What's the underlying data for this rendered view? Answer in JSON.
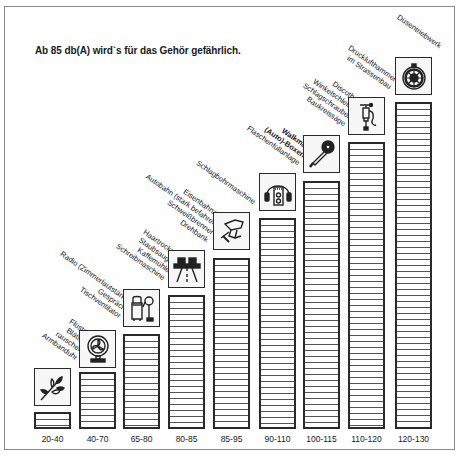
{
  "title": "Ab 85 db(A) wird`s für das Gehör gefährlich.",
  "chart_data": {
    "type": "bar",
    "title": "Ab 85 db(A) wird`s für das Gehör gefährlich.",
    "xlabel": "",
    "ylabel": "dB(A)",
    "categories": [
      "20-40",
      "40-70",
      "65-80",
      "80-85",
      "85-95",
      "90-110",
      "100-115",
      "110-120",
      "120-130"
    ],
    "values": [
      30,
      55,
      72.5,
      82.5,
      90,
      100,
      107.5,
      115,
      125
    ],
    "grid": false,
    "legend": "none",
    "annotations": [
      {
        "category": "20-40",
        "icon": "leaves-icon",
        "lines": [
          "Flüstern",
          "Blätter-",
          "rauschen",
          "Armbanduhr"
        ]
      },
      {
        "category": "40-70",
        "icon": "fan-icon",
        "lines": [
          "Radio (Zimmerlautstärke)",
          "Gespräch",
          "Tischventilator"
        ]
      },
      {
        "category": "65-80",
        "icon": "vacuum-cleaner-icon",
        "lines": [
          "Haartrockner",
          "Staubsauger",
          "Kaffemühle",
          "Schreibmaschine"
        ]
      },
      {
        "category": "80-85",
        "icon": "highway-icon",
        "lines": [
          "Eisenbahnzug",
          "Autobahn (stark befahren)",
          "Schweißbrenner",
          "Drehbank"
        ]
      },
      {
        "category": "85-95",
        "icon": "hammer-drill-icon",
        "lines": [
          "Schlagbohrmaschine"
        ]
      },
      {
        "category": "90-110",
        "icon": "walkman-headphones-icon",
        "lines": [
          "Walkman",
          "(Auto)-Boxen",
          "Flaschenfüllanlage"
        ],
        "bold_lines": [
          0,
          1
        ]
      },
      {
        "category": "100-115",
        "icon": "angle-grinder-icon",
        "lines": [
          "Discothek",
          "Winkelschleifer",
          "Schlagschrauber",
          "Baukreissäge"
        ]
      },
      {
        "category": "110-120",
        "icon": "jackhammer-icon",
        "lines": [
          "Drucklufthammer",
          "im Strassenbau"
        ]
      },
      {
        "category": "120-130",
        "icon": "jet-engine-icon",
        "lines": [
          "Düsentriebwerk"
        ]
      }
    ]
  },
  "bars": [
    {
      "label": "20-40",
      "x": 34,
      "top": 412,
      "icon_top": 368,
      "icon": "leaves-icon",
      "lines": [
        "Flüstern",
        "Blätter-",
        "rauschen",
        "Armbanduhr"
      ],
      "lx": 74,
      "ly": 362
    },
    {
      "label": "40-70",
      "x": 79,
      "top": 372,
      "icon_top": 330,
      "icon": "fan-icon",
      "lines": [
        "Radio (Zimmerlautstärke)",
        "Gespräch",
        "Tischventilator"
      ],
      "lx": 118,
      "ly": 320
    },
    {
      "label": "65-80",
      "x": 123,
      "top": 334,
      "icon_top": 289,
      "icon": "vacuum-cleaner-icon",
      "lines": [
        "Haartrockner",
        "Staubsauger",
        "Kaffemühle",
        "Schreibmaschine"
      ],
      "lx": 162,
      "ly": 282
    },
    {
      "label": "80-85",
      "x": 168,
      "top": 295,
      "icon_top": 250,
      "icon": "highway-icon",
      "lines": [
        "Eisenbahnzug",
        "Autobahn (stark befahren)",
        "Schweißbrenner",
        "Drehbank"
      ],
      "lx": 205,
      "ly": 244
    },
    {
      "label": "85-95",
      "x": 213,
      "top": 258,
      "icon_top": 212,
      "icon": "hammer-drill-icon",
      "lines": [
        "Schlagbohrmaschine"
      ],
      "lx": 252,
      "ly": 206
    },
    {
      "label": "90-110",
      "x": 259,
      "top": 218,
      "icon_top": 173,
      "icon": "walkman-headphones-icon",
      "lines": [
        "Walkman",
        "(Auto)-Boxen",
        "Flaschenfüllanlage"
      ],
      "lx": 297,
      "ly": 167
    },
    {
      "label": "100-115",
      "x": 303,
      "top": 181,
      "icon_top": 135,
      "icon": "angle-grinder-icon",
      "lines": [
        "Discothek",
        "Winkelschleifer",
        "Schlagschrauber",
        "Baukreissäge"
      ],
      "lx": 342,
      "ly": 128
    },
    {
      "label": "110-120",
      "x": 348,
      "top": 142,
      "icon_top": 97,
      "icon": "jackhammer-icon",
      "lines": [
        "Drucklufthammer",
        "im Strassenbau"
      ],
      "lx": 388,
      "ly": 91
    },
    {
      "label": "120-130",
      "x": 395,
      "top": 102,
      "icon_top": 57,
      "icon": "jet-engine-icon",
      "lines": [
        "Düsentriebwerk"
      ],
      "lx": 438,
      "ly": 50
    }
  ],
  "colors": {
    "bar_border": "#2a2a2a",
    "stripe": "#555555",
    "frame": "#8a8a8a",
    "text": "#1a1a1a"
  }
}
